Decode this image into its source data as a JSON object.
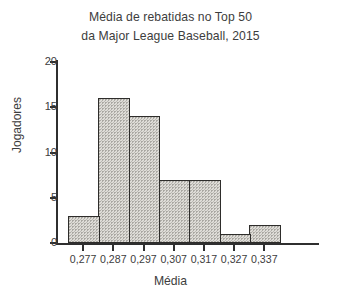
{
  "chart_data": {
    "type": "bar",
    "title": "Média de rebatidas no Top 50 da Major League Baseball, 2015",
    "title_lines": [
      "Média de rebatidas no Top 50",
      "da Major League Baseball, 2015"
    ],
    "xlabel": "Média",
    "ylabel": "Jogadores",
    "categories": [
      "0,277",
      "0,287",
      "0,297",
      "0,307",
      "0,317",
      "0,327",
      "0,337"
    ],
    "values": [
      3,
      16,
      14,
      7,
      7,
      1,
      2
    ],
    "ylim": [
      0,
      20
    ],
    "yticks": [
      0,
      5,
      10,
      15,
      20
    ],
    "ytick_labels": [
      "0",
      "5",
      "10",
      "15",
      "20"
    ],
    "grid": false,
    "legend": false,
    "bar_fill_color": "#dedcd7",
    "bar_edge_color": "#2e2d2b",
    "text_color": "#3d3d3d",
    "background_color": "#ffffff"
  }
}
